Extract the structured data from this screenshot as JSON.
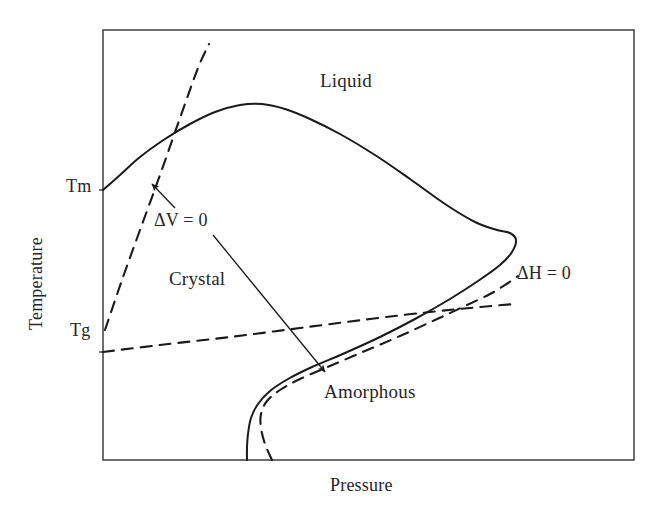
{
  "figure": {
    "type": "phase-diagram",
    "background_color": "#ffffff",
    "line_color": "#1a1a1a",
    "text_color": "#262626"
  },
  "axes": {
    "x_title": "Pressure",
    "y_title": "Temperature",
    "x_tick_labels": [],
    "y_tick_labels": [
      "Tm",
      "Tg"
    ],
    "frame": {
      "left": 103,
      "top": 30,
      "right": 634,
      "bottom": 460
    },
    "grid": false
  },
  "regions": [
    {
      "name": "liquid",
      "label": "Liquid",
      "x": 320,
      "y": 70
    },
    {
      "name": "crystal",
      "label": "Crystal",
      "x": 169,
      "y": 268
    },
    {
      "name": "amorphous",
      "label": "Amorphous",
      "x": 324,
      "y": 381
    }
  ],
  "annotations": [
    {
      "name": "delta-v-zero",
      "label": "ΔV = 0",
      "x": 154,
      "y": 210
    },
    {
      "name": "delta-h-zero",
      "label": "ΔH = 0",
      "x": 517,
      "y": 263
    }
  ],
  "chart_data": {
    "type": "line",
    "title": "",
    "xlabel": "Pressure",
    "ylabel": "Temperature",
    "xlim": [
      103,
      634
    ],
    "ylim": [
      460,
      30
    ],
    "grid": false,
    "legend": "none",
    "y_ticks": [
      {
        "label": "Tm",
        "pixel_y": 190
      },
      {
        "label": "Tg",
        "pixel_y": 352
      }
    ],
    "series": [
      {
        "name": "melting-crystallization-boundary",
        "style": "solid",
        "comment": "Solid melting/phase boundary: rises from Tm on left axis, peaks, sweeps right to a nose, then folds back down to the bottom axis.",
        "points": [
          [
            103,
            190
          ],
          [
            120,
            175
          ],
          [
            140,
            157
          ],
          [
            165,
            139
          ],
          [
            190,
            124
          ],
          [
            215,
            112
          ],
          [
            240,
            105
          ],
          [
            262,
            104
          ],
          [
            285,
            109
          ],
          [
            310,
            119
          ],
          [
            340,
            134
          ],
          [
            375,
            155
          ],
          [
            410,
            179
          ],
          [
            445,
            204
          ],
          [
            475,
            222
          ],
          [
            497,
            230
          ],
          [
            510,
            233
          ],
          [
            516,
            240
          ],
          [
            512,
            252
          ],
          [
            500,
            265
          ],
          [
            478,
            281
          ],
          [
            450,
            299
          ],
          [
            415,
            319
          ],
          [
            380,
            337
          ],
          [
            345,
            353
          ],
          [
            312,
            367
          ],
          [
            288,
            379
          ],
          [
            270,
            391
          ],
          [
            258,
            404
          ],
          [
            251,
            418
          ],
          [
            248,
            434
          ],
          [
            247,
            448
          ],
          [
            247,
            460
          ]
        ]
      },
      {
        "name": "delta-v-zero-steep-line",
        "style": "dashed",
        "comment": "Steep dashed line from Tg point on the left axis rising up through the melting curve toward the top of the frame.",
        "points": [
          [
            105,
            330
          ],
          [
            122,
            280
          ],
          [
            140,
            230
          ],
          [
            160,
            175
          ],
          [
            180,
            118
          ],
          [
            198,
            68
          ],
          [
            209,
            44
          ]
        ]
      },
      {
        "name": "glass-transition-line",
        "style": "dashed",
        "comment": "Gently rising dashed Tg line from left axis across to the right, crossing the amorphous boundary dashed line.",
        "points": [
          [
            103,
            352
          ],
          [
            160,
            345
          ],
          [
            230,
            337
          ],
          [
            300,
            328
          ],
          [
            370,
            319
          ],
          [
            430,
            312
          ],
          [
            480,
            307
          ],
          [
            515,
            304
          ]
        ]
      },
      {
        "name": "amorphous-boundary-dashed",
        "style": "dashed",
        "comment": "Dashed curve mirroring the lower solid boundary, running from the bottom axis up to the right toward the delta-H=0 label.",
        "points": [
          [
            272,
            460
          ],
          [
            265,
            444
          ],
          [
            261,
            428
          ],
          [
            261,
            414
          ],
          [
            267,
            401
          ],
          [
            280,
            390
          ],
          [
            300,
            379
          ],
          [
            330,
            366
          ],
          [
            365,
            351
          ],
          [
            400,
            336
          ],
          [
            435,
            320
          ],
          [
            465,
            306
          ],
          [
            490,
            294
          ],
          [
            508,
            283
          ],
          [
            518,
            276
          ]
        ]
      }
    ],
    "arrows": [
      {
        "name": "delta-v-upper-arrow",
        "comment": "From the delta-V = 0 label up-left to the steep dashed line.",
        "from": [
          175,
          208
        ],
        "to": [
          152,
          184
        ]
      },
      {
        "name": "delta-v-lower-arrow",
        "comment": "From the delta-V = 0 label down-right to the amorphous dashed boundary.",
        "from": [
          213,
          235
        ],
        "to": [
          325,
          372
        ]
      }
    ]
  }
}
